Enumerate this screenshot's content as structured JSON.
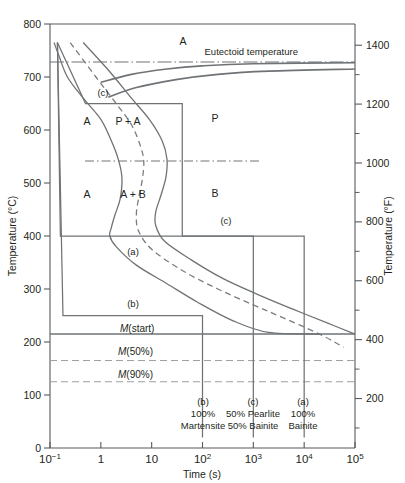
{
  "figure": {
    "type": "ttt-isothermal-transformation-diagram",
    "xlabel": "Time (s)",
    "ylabel_left": "Temperature (°C)",
    "ylabel_right": "Temperature (°F)",
    "eutectoid_label": "Eutectoid temperature"
  },
  "axes": {
    "x": {
      "scale": "log",
      "min": 0.1,
      "max": 100000,
      "ticks": [
        {
          "base": "10",
          "exp": "−1",
          "value": 0.1
        },
        {
          "base": "1",
          "exp": "",
          "value": 1
        },
        {
          "base": "10",
          "exp": "",
          "value": 10
        },
        {
          "base": "10",
          "exp": "2",
          "value": 100
        },
        {
          "base": "10",
          "exp": "3",
          "value": 1000
        },
        {
          "base": "10",
          "exp": "4",
          "value": 10000
        },
        {
          "base": "10",
          "exp": "5",
          "value": 100000
        }
      ]
    },
    "y_left": {
      "unit": "°C",
      "min": 0,
      "max": 800,
      "ticks": [
        0,
        100,
        200,
        300,
        400,
        500,
        600,
        700,
        800
      ],
      "labels": [
        "0",
        "100",
        "200",
        "300",
        "400",
        "500",
        "600",
        "700",
        "800"
      ]
    },
    "y_right": {
      "unit": "°F",
      "major_ticks": [
        200,
        400,
        600,
        800,
        1000,
        1200,
        1400
      ],
      "major_labels": [
        "200",
        "400",
        "600",
        "800",
        "1000",
        "1200",
        "1400"
      ],
      "minor_ticks": [
        100,
        300,
        500,
        700,
        900,
        1100,
        1300,
        1500
      ]
    }
  },
  "region_labels": [
    {
      "text": "A",
      "x_px": 183,
      "y_px": 45
    },
    {
      "text": "A",
      "x_px": 87,
      "y_px": 125
    },
    {
      "text": "A",
      "x_px": 87,
      "y_px": 198
    },
    {
      "text": "P + A",
      "x_px": 128,
      "y_px": 125
    },
    {
      "text": "A + B",
      "x_px": 133,
      "y_px": 198
    },
    {
      "text": "P",
      "x_px": 215,
      "y_px": 122
    },
    {
      "text": "B",
      "x_px": 215,
      "y_px": 197
    }
  ],
  "path_labels": [
    {
      "text": "(c)",
      "x_px": 103,
      "y_px": 96
    },
    {
      "text": "(c)",
      "x_px": 226,
      "y_px": 224
    },
    {
      "text": "(a)",
      "x_px": 133,
      "y_px": 255
    },
    {
      "text": "(b)",
      "x_px": 133,
      "y_px": 307
    }
  ],
  "martensite_lines": [
    {
      "label": "M(start)",
      "italic_prefix": "M",
      "rest": "(start)",
      "temp_c": 215,
      "style": "solid",
      "label_x_px": 120,
      "label_y_px": 332
    },
    {
      "label": "M(50%)",
      "italic_prefix": "M",
      "rest": "(50%)",
      "temp_c": 165,
      "style": "dashed",
      "label_x_px": 118,
      "label_y_px": 355
    },
    {
      "label": "M(90%)",
      "italic_prefix": "M",
      "rest": "(90%)",
      "temp_c": 125,
      "style": "dashed",
      "label_x_px": 118,
      "label_y_px": 378
    }
  ],
  "eutectoid_temp_c": 727,
  "isotherm_dashdot_temp_c": 540,
  "bottom_annotations": [
    {
      "tag": "(b)",
      "line1": "100%",
      "line2": "Martensite",
      "x_px": 203
    },
    {
      "tag": "(c)",
      "line1": "50% Pearlite",
      "line2": "50% Bainite",
      "x_px": 253
    },
    {
      "tag": "(a)",
      "line1": "100%",
      "line2": "Bainite",
      "x_px": 303
    }
  ],
  "colors": {
    "curve": "#6f7376",
    "axis": "#58595b",
    "text": "#231f20",
    "dashed_curve": "#7a7e81",
    "martensite_dash": "#9b9fa2"
  },
  "chart_data": {
    "type": "line",
    "xlabel": "Time (s)",
    "ylabel": "Temperature (°C)",
    "xlim": [
      0.1,
      100000
    ],
    "ylim": [
      0,
      800
    ],
    "grid": false,
    "legend": "none",
    "series": [
      {
        "name": "transformation start (A → P/B)",
        "style": "solid",
        "points": [
          [
            0.12,
            765
          ],
          [
            0.15,
            740
          ],
          [
            0.22,
            700
          ],
          [
            0.45,
            660
          ],
          [
            1.0,
            620
          ],
          [
            1.6,
            580
          ],
          [
            2.2,
            545
          ],
          [
            2.6,
            510
          ],
          [
            2.4,
            470
          ],
          [
            1.9,
            440
          ],
          [
            1.6,
            415
          ],
          [
            1.5,
            400
          ],
          [
            2.0,
            380
          ],
          [
            5,
            345
          ],
          [
            20,
            310
          ],
          [
            80,
            275
          ],
          [
            400,
            240
          ],
          [
            2000,
            218
          ],
          [
            20000,
            215
          ]
        ]
      },
      {
        "name": "transformation 50% complete",
        "style": "dashed",
        "points": [
          [
            0.25,
            765
          ],
          [
            0.8,
            700
          ],
          [
            2.0,
            650
          ],
          [
            4.0,
            610
          ],
          [
            6.0,
            570
          ],
          [
            7.0,
            540
          ],
          [
            6.5,
            505
          ],
          [
            5.5,
            470
          ],
          [
            5.0,
            440
          ],
          [
            5.5,
            410
          ],
          [
            10,
            375
          ],
          [
            40,
            335
          ],
          [
            200,
            300
          ],
          [
            1000,
            270
          ],
          [
            4000,
            245
          ],
          [
            20000,
            215
          ],
          [
            60000,
            190
          ]
        ]
      },
      {
        "name": "transformation end (100% complete)",
        "style": "solid",
        "points": [
          [
            0.45,
            765
          ],
          [
            1.5,
            710
          ],
          [
            4,
            660
          ],
          [
            9,
            620
          ],
          [
            16,
            580
          ],
          [
            20,
            545
          ],
          [
            19,
            510
          ],
          [
            15,
            475
          ],
          [
            12,
            445
          ],
          [
            12,
            420
          ],
          [
            18,
            390
          ],
          [
            60,
            355
          ],
          [
            250,
            320
          ],
          [
            1200,
            290
          ],
          [
            6000,
            262
          ],
          [
            30000,
            235
          ],
          [
            100000,
            215
          ]
        ]
      },
      {
        "name": "upper equilibrium boundary",
        "style": "solid",
        "points": [
          [
            1.0,
            690
          ],
          [
            4,
            705
          ],
          [
            20,
            715
          ],
          [
            100,
            721
          ],
          [
            1000,
            725
          ],
          [
            100000,
            727
          ]
        ]
      },
      {
        "name": "lower equilibrium boundary",
        "style": "solid",
        "points": [
          [
            1.4,
            662
          ],
          [
            5,
            680
          ],
          [
            30,
            695
          ],
          [
            200,
            705
          ],
          [
            2000,
            711
          ],
          [
            100000,
            715
          ]
        ]
      }
    ],
    "cooling_paths": [
      {
        "name": "(a) 100% Bainite",
        "points": [
          [
            0.14,
            765
          ],
          [
            0.16,
            400
          ],
          [
            10,
            400
          ],
          [
            10000,
            400
          ],
          [
            10000,
            20
          ]
        ],
        "hold_temp_c": 400,
        "quench_time_s": 10000,
        "result": "100% Bainite"
      },
      {
        "name": "(b) 100% Martensite",
        "points": [
          [
            0.14,
            765
          ],
          [
            0.18,
            250
          ],
          [
            100,
            250
          ],
          [
            100,
            20
          ]
        ],
        "hold_temp_c": 250,
        "quench_time_s": 100,
        "result": "100% Martensite"
      },
      {
        "name": "(c) 50% Pearlite 50% Bainite",
        "points": [
          [
            0.14,
            765
          ],
          [
            0.5,
            650
          ],
          [
            40,
            650
          ],
          [
            40,
            400
          ],
          [
            1000,
            400
          ],
          [
            1000,
            20
          ]
        ],
        "hold_temp_c_first": 650,
        "hold_temp_c_second": 400,
        "quench_time_s": 1000,
        "result": "50% Pearlite, 50% Bainite"
      }
    ]
  }
}
